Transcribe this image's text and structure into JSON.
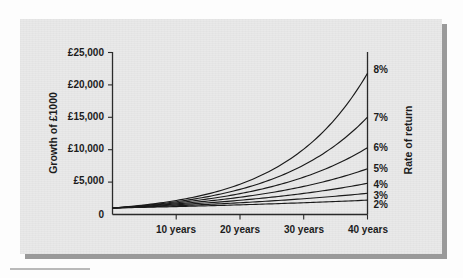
{
  "figure": {
    "panel_bg": "#e9e9e9",
    "page_bg": "#fdfdfd",
    "ink": "#1a1a1a"
  },
  "chart_data": {
    "type": "line",
    "title": "",
    "subtitle": "",
    "xlabel": "",
    "ylabel": "Growth of £1000",
    "y2label": "Rate of return",
    "xlim": [
      0,
      40
    ],
    "ylim": [
      0,
      25000
    ],
    "grid": false,
    "legend_position": "right-axis-end-labels",
    "x_tick_labels": [
      "10 years",
      "20 years",
      "30 years",
      "40 years"
    ],
    "x_tick_values": [
      10,
      20,
      30,
      40
    ],
    "y_tick_labels": [
      "0",
      "£5,000",
      "£10,000",
      "£15,000",
      "£20,000",
      "£25,000"
    ],
    "y_tick_values": [
      0,
      5000,
      10000,
      15000,
      20000,
      25000
    ],
    "principal": 1000,
    "x": [
      0,
      5,
      10,
      15,
      20,
      25,
      30,
      35,
      40
    ],
    "series": [
      {
        "name": "8%",
        "rate": 8,
        "end_label": "8%",
        "values": [
          1000,
          1469,
          2159,
          3172,
          4661,
          6848,
          10063,
          14785,
          21725
        ]
      },
      {
        "name": "7%",
        "rate": 7,
        "end_label": "7%",
        "values": [
          1000,
          1403,
          1967,
          2759,
          3870,
          5427,
          7612,
          10677,
          14974
        ]
      },
      {
        "name": "6%",
        "rate": 6,
        "end_label": "6%",
        "values": [
          1000,
          1338,
          1791,
          2397,
          3207,
          4292,
          5743,
          7686,
          10286
        ]
      },
      {
        "name": "5%",
        "rate": 5,
        "end_label": "5%",
        "values": [
          1000,
          1276,
          1629,
          2079,
          2653,
          3386,
          4322,
          5516,
          7040
        ]
      },
      {
        "name": "4%",
        "rate": 4,
        "end_label": "4%",
        "values": [
          1000,
          1217,
          1480,
          1801,
          2191,
          2666,
          3243,
          3946,
          4801
        ]
      },
      {
        "name": "3%",
        "rate": 3,
        "end_label": "3%",
        "values": [
          1000,
          1159,
          1344,
          1558,
          1806,
          2094,
          2427,
          2814,
          3262
        ]
      },
      {
        "name": "2%",
        "rate": 2,
        "end_label": "2%",
        "values": [
          1000,
          1104,
          1219,
          1346,
          1486,
          1641,
          1811,
          2000,
          2208
        ]
      }
    ],
    "annotations": []
  },
  "axis": {
    "y_label": "Growth of £1000",
    "y2_label": "Rate of return",
    "y_ticks": [
      "£25,000",
      "£20,000",
      "£15,000",
      "£10,000",
      "£5,000",
      "0"
    ],
    "x_ticks": [
      "10 years",
      "20 years",
      "30 years",
      "40 years"
    ],
    "rate_labels": [
      "8%",
      "7%",
      "6%",
      "5%",
      "4%",
      "3%",
      "2%"
    ]
  }
}
